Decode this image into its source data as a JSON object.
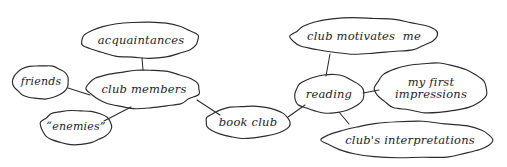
{
  "diagram": {
    "background_color": "#ffffff",
    "ink_color": "#2b2b30",
    "style": "hand-drawn pen sketch"
  },
  "nodes": [
    {
      "id": "acquaintances",
      "label": "acquaintances",
      "cx": 141,
      "cy": 40,
      "rx": 59,
      "ry": 18,
      "font_size": 11.5,
      "lines": [
        "acquaintances"
      ]
    },
    {
      "id": "friends",
      "label": "friends",
      "cx": 41,
      "cy": 82,
      "rx": 28,
      "ry": 17,
      "font_size": 11,
      "lines": [
        "friends"
      ]
    },
    {
      "id": "club-members",
      "label": "club members",
      "cx": 144,
      "cy": 89,
      "rx": 56,
      "ry": 19,
      "font_size": 11.5,
      "lines": [
        "club members"
      ]
    },
    {
      "id": "enemies",
      "label": "“enemies”",
      "cx": 76,
      "cy": 127,
      "rx": 36,
      "ry": 17,
      "font_size": 11,
      "lines": [
        "“enemies”"
      ]
    },
    {
      "id": "book-club",
      "label": "book club",
      "cx": 248,
      "cy": 122,
      "rx": 42,
      "ry": 16,
      "font_size": 11.5,
      "lines": [
        "book club"
      ]
    },
    {
      "id": "club-motivates-me",
      "label": "club motivates me",
      "cx": 364,
      "cy": 36,
      "rx": 73,
      "ry": 18,
      "font_size": 11.5,
      "lines": [
        "club motivates  me"
      ]
    },
    {
      "id": "reading",
      "label": "reading",
      "cx": 329,
      "cy": 94,
      "rx": 35,
      "ry": 19,
      "font_size": 11.5,
      "lines": [
        "reading"
      ]
    },
    {
      "id": "my-first-impressions",
      "label": "my first impressions",
      "cx": 431,
      "cy": 88,
      "rx": 56,
      "ry": 25,
      "font_size": 11.5,
      "lines": [
        "my first",
        "impressions"
      ]
    },
    {
      "id": "clubs-interpretations",
      "label": "club's interpretations",
      "cx": 410,
      "cy": 140,
      "rx": 85,
      "ry": 18,
      "font_size": 11.5,
      "lines": [
        "club's interpretations"
      ]
    }
  ],
  "edges": [
    {
      "id": "acquaintances-club-members",
      "from": "acquaintances",
      "to": "club-members",
      "path": "M 142 58 L 143 70"
    },
    {
      "id": "friends-club-members",
      "from": "friends",
      "to": "club-members",
      "path": "M 68 88 L 90 95"
    },
    {
      "id": "enemies-club-members",
      "from": "enemies",
      "to": "club-members",
      "path": "M 104 121 L 131 107"
    },
    {
      "id": "club-members-book-club",
      "from": "club-members",
      "to": "book-club",
      "path": "M 197 100 L 220 115"
    },
    {
      "id": "book-club-reading",
      "from": "book-club",
      "to": "reading",
      "path": "M 288 117 L 305 105"
    },
    {
      "id": "club-motivates-me-reading",
      "from": "club-motivates-me",
      "to": "reading",
      "path": "M 330 54 L 326 76"
    },
    {
      "id": "reading-my-first-impressions",
      "from": "reading",
      "to": "my-first-impressions",
      "path": "M 363 93 L 379 90"
    },
    {
      "id": "reading-clubs-interpretations",
      "from": "reading",
      "to": "clubs-interpretations",
      "path": "M 339 112 L 349 124"
    }
  ]
}
